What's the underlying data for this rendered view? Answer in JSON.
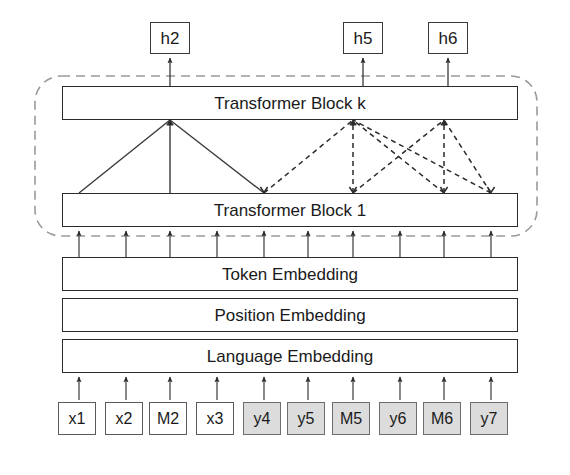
{
  "diagram": {
    "outputs": [
      {
        "label": "h2",
        "x": 150,
        "name": "output-node-h2"
      },
      {
        "label": "h5",
        "x": 343,
        "name": "output-node-h5"
      },
      {
        "label": "h6",
        "x": 428,
        "name": "output-node-h6"
      }
    ],
    "blocks": [
      {
        "label": "Transformer Block k",
        "y": 86,
        "name": "transformer-block-k"
      },
      {
        "label": "Transformer Block 1",
        "y": 193,
        "name": "transformer-block-1"
      }
    ],
    "embeddings": [
      {
        "label": "Token Embedding",
        "y": 257,
        "name": "token-embedding-layer"
      },
      {
        "label": "Position Embedding",
        "y": 298,
        "name": "position-embedding-layer"
      },
      {
        "label": "Language Embedding",
        "y": 339,
        "name": "language-embedding-layer"
      }
    ],
    "tokens": [
      {
        "label": "x1",
        "x": 58,
        "shaded": false
      },
      {
        "label": "x2",
        "x": 105,
        "shaded": false
      },
      {
        "label": "M2",
        "x": 149,
        "shaded": false
      },
      {
        "label": "x3",
        "x": 196,
        "shaded": false
      },
      {
        "label": "y4",
        "x": 243,
        "shaded": true
      },
      {
        "label": "y5",
        "x": 287,
        "shaded": true
      },
      {
        "label": "M5",
        "x": 332,
        "shaded": true
      },
      {
        "label": "y6",
        "x": 379,
        "shaded": true
      },
      {
        "label": "M6",
        "x": 423,
        "shaded": true
      },
      {
        "label": "y7",
        "x": 470,
        "shaded": true
      }
    ],
    "column_x": [
      79,
      126,
      170,
      217,
      264,
      308,
      353,
      400,
      444,
      491
    ],
    "attention": {
      "solid_apex_x": 170,
      "solid_sources_x": [
        79,
        170,
        264
      ],
      "dashed_groups": [
        {
          "apex_x": 353,
          "sources_x": [
            264,
            353,
            444,
            491
          ]
        },
        {
          "apex_x": 444,
          "sources_x": [
            353,
            444,
            491
          ]
        }
      ]
    },
    "colors": {
      "stroke": "#3a3a3a",
      "block_stroke": "#2b2b2b",
      "shaded_fill": "#dcdcdc",
      "dashed_boundary": "#9a9a9a",
      "background": "#ffffff"
    },
    "boundary": {
      "name": "transformer-stack-boundary",
      "x": 35,
      "y": 76,
      "width": 502,
      "height": 160,
      "radius": 26
    }
  }
}
